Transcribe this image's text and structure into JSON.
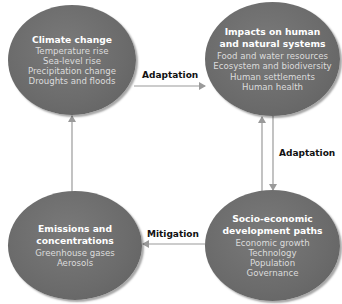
{
  "nodes": {
    "climate": {
      "title": "Climate change",
      "items": [
        "Temperature rise",
        "Sea-level rise",
        "Precipitation change",
        "Droughts and floods"
      ]
    },
    "impacts": {
      "title_line1": "Impacts on human",
      "title_line2": "and natural systems",
      "items": [
        "Food and water resources",
        "Ecosystem and biodiversity",
        "Human settlements",
        "Human health"
      ]
    },
    "emissions": {
      "title_line1": "Emissions and",
      "title_line2": "concentrations",
      "items": [
        "Greenhouse gases",
        "Aerosols"
      ]
    },
    "socio": {
      "title_line1": "Socio-economic",
      "title_line2": "development paths",
      "items": [
        "Economic growth",
        "Technology",
        "Population",
        "Governance"
      ]
    }
  },
  "edges": {
    "climate_to_impacts": "Adaptation",
    "impacts_socio": "Adaptation",
    "socio_to_emissions": "Mitigation"
  },
  "colors": {
    "node_fill": "#6b6b6b",
    "arrow": "#9a9a9a",
    "label_text": "#111111"
  }
}
